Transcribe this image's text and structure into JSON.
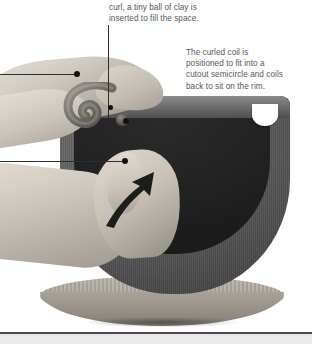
{
  "figure": {
    "captions": [
      {
        "id": "top",
        "text": "curl, a tiny ball of clay is\ninserted to fill the space."
      },
      {
        "id": "right",
        "text": "The curled coil is\npositioned to fit into a\ncutout semicircle and coils\nback to sit on the rim."
      }
    ],
    "annotations": {
      "leader_vertical": "leader-line-to-clay-ball",
      "leader_left_upper": "leader-line-upper-hand",
      "leader_left_lower": "leader-line-lower-hand",
      "leader_diagonal": "leader-line-to-rim-notch",
      "motion_arrow": "upward-pressing-arrow"
    },
    "objects": {
      "bowl": "clay-bowl",
      "rim_notch": "cutout-semicircle",
      "coil": "curled-clay-coil",
      "clay_ball": "tiny-clay-ball",
      "turntable": "banding-wheel",
      "hand_upper": "upper-hand",
      "hand_lower": "lower-hand"
    },
    "colors": {
      "caption_text": "#58585a",
      "leader_line": "#2e2e2e",
      "bowl_body": "#5a5a5a",
      "bowl_interior": "#232323",
      "turntable": "#a8a49b",
      "background": "#ffffff",
      "rule": "#4d4d4d"
    }
  }
}
